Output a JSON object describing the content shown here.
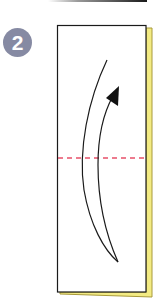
{
  "diagram": {
    "type": "origami-instruction-step",
    "step": {
      "number": "2",
      "badge_color": "#868aa3",
      "badge_text_color": "#ffffff"
    },
    "paper": {
      "fill": "#ffffff",
      "stroke": "#1a1a1a",
      "back_layer_color": "#f3eb83",
      "back_layer_stroke": "#a89a3a"
    },
    "fold_line": {
      "style": "dashed",
      "color": "#e8506a",
      "kind": "valley-fold"
    },
    "arrow": {
      "direction": "up",
      "meaning": "fold bottom half up",
      "color": "#111111"
    },
    "previous_step_fragment": {
      "description": "bottom edge of previous diagram"
    }
  }
}
